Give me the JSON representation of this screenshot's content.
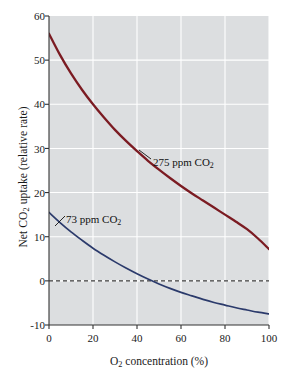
{
  "chart_data": {
    "type": "line",
    "title": "",
    "subtitle": "",
    "xlabel": "O2 concentration (%)",
    "xlabel_parts": {
      "pre": "O",
      "sub": "2",
      "post": " concentration (%)"
    },
    "ylabel": "Net CO2 uptake (relative rate)",
    "ylabel_parts": {
      "pre": "Net CO",
      "sub": "2",
      "post": " uptake (relative rate)"
    },
    "xlim": [
      0,
      100
    ],
    "ylim": [
      -10,
      60
    ],
    "xticks": [
      0,
      20,
      40,
      60,
      80,
      100
    ],
    "yticks": [
      -10,
      0,
      10,
      20,
      30,
      40,
      50,
      60
    ],
    "xtick_labels": [
      "0",
      "20",
      "40",
      "60",
      "80",
      "100"
    ],
    "ytick_labels": [
      "-10",
      "0",
      "10",
      "20",
      "30",
      "40",
      "50",
      "60"
    ],
    "grid": true,
    "grid_color": "#ffffff",
    "plot_background": "#dcdee0",
    "legend_position": "inline-annotations",
    "zero_reference_line": {
      "y": 0,
      "style": "dashed",
      "color": "#3b3b3b"
    },
    "series": [
      {
        "name": "275 ppm CO2",
        "label": "275 ppm CO2",
        "label_parts": {
          "pre": "275 ppm CO",
          "sub": "2"
        },
        "color": "#7b1b22",
        "x": [
          0,
          5,
          10,
          15,
          20,
          25,
          30,
          35,
          40,
          45,
          50,
          55,
          60,
          65,
          70,
          75,
          80,
          85,
          90,
          95,
          100
        ],
        "values": [
          56.0,
          51.2,
          47.0,
          43.3,
          40.0,
          37.0,
          34.2,
          31.7,
          29.4,
          27.2,
          25.2,
          23.3,
          21.5,
          19.8,
          18.2,
          16.6,
          15.0,
          13.4,
          11.7,
          9.6,
          7.2
        ]
      },
      {
        "name": "73 ppm CO2",
        "label": "73 ppm CO2",
        "label_parts": {
          "pre": "73 ppm CO",
          "sub": "2"
        },
        "color": "#2b3a6b",
        "x": [
          0,
          5,
          10,
          15,
          20,
          25,
          30,
          35,
          40,
          45,
          50,
          55,
          60,
          65,
          70,
          75,
          80,
          85,
          90,
          95,
          100
        ],
        "values": [
          15.5,
          13.2,
          11.1,
          9.2,
          7.4,
          5.8,
          4.3,
          2.9,
          1.6,
          0.4,
          -0.7,
          -1.7,
          -2.6,
          -3.4,
          -4.2,
          -4.9,
          -5.5,
          -6.1,
          -6.6,
          -7.1,
          -7.5
        ]
      }
    ],
    "annotations": [
      {
        "text": "275 ppm CO2",
        "series": "275 ppm CO2",
        "leader": true
      },
      {
        "text": "73 ppm CO2",
        "series": "73 ppm CO2",
        "leader": true
      }
    ]
  }
}
